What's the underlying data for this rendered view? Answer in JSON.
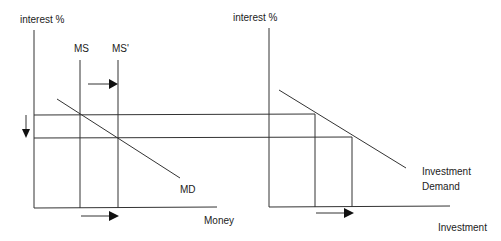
{
  "left_diagram": {
    "y_axis_label": "interest %",
    "x_axis_label": "Money",
    "curves": {
      "ms": "MS",
      "ms_prime": "MS'",
      "md": "MD"
    }
  },
  "right_diagram": {
    "y_axis_label": "interest %",
    "x_axis_label": "Investment",
    "curve_label_line1": "Investment",
    "curve_label_line2": "Demand"
  },
  "colors": {
    "line": "#333333",
    "text": "#222222",
    "background": "#ffffff"
  }
}
